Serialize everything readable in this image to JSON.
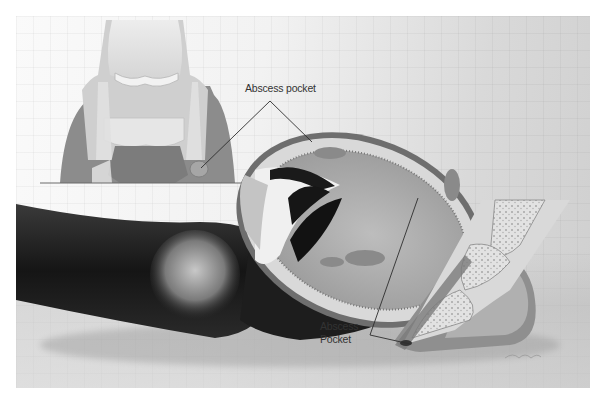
{
  "illustration": {
    "subject": "Equine hoof abscess anatomy",
    "labels": {
      "top": "Abscess pocket",
      "bottom_line1": "Abscess",
      "bottom_line2": "Pocket"
    },
    "views": [
      "front-view-cross-section",
      "hoof-sole-view",
      "side-sagittal-section"
    ],
    "colors": {
      "background_light": "#f4f4f4",
      "background_dark": "#cfcfcf",
      "limb_dark": "#1e1e1e",
      "bone_light": "#e6e6e6",
      "hoof_wall": "#8a8a8a",
      "abscess": "#9a9a9a",
      "leader_line": "#333333"
    }
  }
}
